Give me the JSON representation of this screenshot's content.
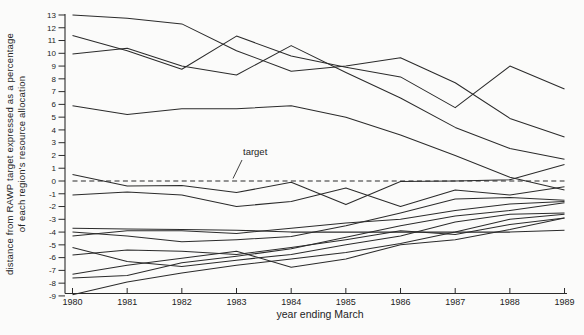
{
  "figure": {
    "y_axis": {
      "label_line1": "distance from RAWP target expressed as a percentage",
      "label_line2": "of each region's resource allocation",
      "tick_labels": [
        13,
        12,
        11,
        10,
        9,
        8,
        7,
        6,
        5,
        4,
        3,
        2,
        1,
        0,
        -1,
        -2,
        -3,
        -4,
        -5,
        -6,
        -7,
        -8,
        -9
      ]
    },
    "x_axis": {
      "label": "year ending March",
      "tick_labels": [
        1980,
        1981,
        1982,
        1983,
        1984,
        1985,
        1986,
        1987,
        1988,
        1989
      ]
    },
    "annotation": {
      "target_label": "target"
    },
    "colors": {
      "background": "#fbfbfa",
      "line": "#2b2b2b",
      "axis": "#2b2b2b",
      "text": "#1c1c1c"
    }
  },
  "chart_data": {
    "type": "line",
    "title": "",
    "xlabel": "year ending March",
    "ylabel": "distance from RAWP target expressed as a percentage of each region's resource allocation",
    "x": [
      1980,
      1981,
      1982,
      1983,
      1984,
      1985,
      1986,
      1987,
      1988,
      1989
    ],
    "ylim": [
      -9,
      13
    ],
    "xlim": [
      1980,
      1989
    ],
    "grid": false,
    "legend_position": "none",
    "annotations": [
      {
        "text": "target",
        "refers_to": "target-line",
        "x": 1983.1,
        "y": 2.0
      }
    ],
    "series": [
      {
        "name": "target",
        "style": "dashed",
        "values": [
          0,
          0,
          0,
          0,
          0,
          0,
          0,
          0,
          0,
          0
        ]
      },
      {
        "name": "region-line-1",
        "style": "solid",
        "values": [
          13.0,
          12.75,
          12.3,
          10.2,
          8.6,
          9.0,
          9.65,
          7.7,
          4.9,
          3.45
        ]
      },
      {
        "name": "region-line-2",
        "style": "solid",
        "values": [
          11.4,
          10.2,
          8.75,
          11.35,
          9.8,
          8.9,
          8.15,
          5.75,
          9.0,
          7.2
        ]
      },
      {
        "name": "region-line-3",
        "style": "solid",
        "values": [
          9.95,
          10.4,
          9.0,
          8.3,
          10.6,
          8.5,
          6.5,
          4.2,
          2.55,
          1.7
        ]
      },
      {
        "name": "region-line-4",
        "style": "solid",
        "values": [
          5.9,
          5.2,
          5.65,
          5.65,
          5.9,
          5.0,
          3.6,
          2.0,
          0.3,
          -0.7
        ]
      },
      {
        "name": "region-line-5",
        "style": "solid",
        "values": [
          0.5,
          -0.4,
          -0.35,
          -0.9,
          -0.1,
          -1.85,
          -0.05,
          0.0,
          0.1,
          1.3
        ]
      },
      {
        "name": "region-line-6",
        "style": "solid",
        "values": [
          -1.1,
          -0.85,
          -1.1,
          -2.0,
          -1.6,
          -0.55,
          -2.0,
          -0.7,
          -1.1,
          -0.45
        ]
      },
      {
        "name": "region-line-7",
        "style": "solid",
        "values": [
          -3.7,
          -3.75,
          -3.8,
          -3.85,
          -4.0,
          -4.0,
          -4.0,
          -4.0,
          -4.0,
          -3.85
        ]
      },
      {
        "name": "region-line-8",
        "style": "solid",
        "values": [
          -4.0,
          -4.3,
          -4.75,
          -4.6,
          -4.35,
          -3.5,
          -2.5,
          -1.4,
          -1.3,
          -1.5
        ]
      },
      {
        "name": "region-line-9",
        "style": "solid",
        "values": [
          -4.3,
          -3.9,
          -3.9,
          -4.1,
          -3.7,
          -3.3,
          -3.0,
          -2.3,
          -1.8,
          -1.6
        ]
      },
      {
        "name": "region-line-10",
        "style": "solid",
        "values": [
          -5.2,
          -6.3,
          -6.7,
          -6.2,
          -5.75,
          -5.0,
          -4.3,
          -3.2,
          -2.6,
          -2.5
        ]
      },
      {
        "name": "region-line-11",
        "style": "solid",
        "values": [
          -5.8,
          -5.4,
          -5.5,
          -5.75,
          -5.2,
          -4.6,
          -3.9,
          -4.2,
          -3.4,
          -2.9
        ]
      },
      {
        "name": "region-line-12",
        "style": "solid",
        "values": [
          -7.3,
          -6.6,
          -6.05,
          -5.5,
          -6.75,
          -6.1,
          -5.0,
          -4.6,
          -3.8,
          -2.9
        ]
      },
      {
        "name": "region-line-13",
        "style": "solid",
        "values": [
          -7.6,
          -7.4,
          -6.4,
          -5.9,
          -5.3,
          -4.4,
          -3.5,
          -2.75,
          -2.3,
          -1.7
        ]
      },
      {
        "name": "region-line-14",
        "style": "solid",
        "values": [
          -8.9,
          -7.9,
          -7.2,
          -6.6,
          -6.1,
          -5.6,
          -4.9,
          -4.0,
          -3.0,
          -2.6
        ]
      }
    ]
  }
}
